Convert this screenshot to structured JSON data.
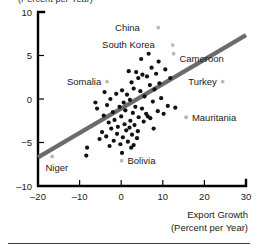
{
  "figure": {
    "ylabel_top_fragment": "(Percent per Year)",
    "footer_rule": "horizontal-rule"
  },
  "chart_data": {
    "type": "scatter",
    "title": "",
    "xlabel": "Export Growth",
    "xlabel_sub": "(Percent per Year)",
    "ylabel": "GDP Growth",
    "ylabel_sub": "(Percent per Year)",
    "xlim": [
      -20,
      30
    ],
    "ylim": [
      -10,
      10
    ],
    "xticks": [
      -20,
      -10,
      0,
      10,
      20,
      30
    ],
    "xtick_labels": [
      "–20",
      "–10",
      "0",
      "10",
      "20",
      "30"
    ],
    "yticks": [
      -10,
      -5,
      0,
      5,
      10
    ],
    "ytick_labels": [
      "–10",
      "−5",
      "0",
      "5",
      "10"
    ],
    "grid": false,
    "legend": "none",
    "trendline": {
      "type": "linear-fit",
      "x_start": -20,
      "y_start": -6.6,
      "x_end": 30,
      "y_end": 8.1,
      "color": "#6b6b6b"
    },
    "marker_color": "#111111",
    "highlight_marker_color": "#b9b9b9",
    "annotations": [
      {
        "label": "China",
        "x": 8.9,
        "y": 8.2,
        "label_x": 4.5,
        "label_y": 8.2,
        "anchor": "end"
      },
      {
        "label": "South Korea",
        "x": 12.4,
        "y": 6.2,
        "label_x": 8.1,
        "label_y": 6.2,
        "anchor": "end"
      },
      {
        "label": "Cameroon",
        "x": 12.6,
        "y": 5.2,
        "label_x": 14.0,
        "label_y": 4.7,
        "anchor": "start"
      },
      {
        "label": "Somalia",
        "x": -3.4,
        "y": 2.0,
        "label_x": -4.8,
        "label_y": 2.0,
        "anchor": "end"
      },
      {
        "label": "Turkey",
        "x": 24.4,
        "y": 2.0,
        "label_x": 23.0,
        "label_y": 2.0,
        "anchor": "end"
      },
      {
        "label": "Mauritania",
        "x": 15.6,
        "y": -2.1,
        "label_x": 17.0,
        "label_y": -2.1,
        "anchor": "start"
      },
      {
        "label": "Bolivia",
        "x": 0.1,
        "y": -7.1,
        "label_x": 1.5,
        "label_y": -7.1,
        "anchor": "start"
      },
      {
        "label": "Niger",
        "x": -16.6,
        "y": -6.6,
        "label_x": -18.2,
        "label_y": -7.9,
        "anchor": "start"
      }
    ],
    "points": [
      {
        "x": 6.6,
        "y": 5.2
      },
      {
        "x": 9.0,
        "y": 4.3
      },
      {
        "x": 7.3,
        "y": 3.6
      },
      {
        "x": 10.6,
        "y": 3.4
      },
      {
        "x": 1.8,
        "y": 3.2
      },
      {
        "x": 3.6,
        "y": 3.1
      },
      {
        "x": 5.1,
        "y": 2.8
      },
      {
        "x": 6.2,
        "y": 2.6
      },
      {
        "x": 4.1,
        "y": 2.4
      },
      {
        "x": 8.4,
        "y": 2.9
      },
      {
        "x": 11.8,
        "y": 2.4
      },
      {
        "x": 2.5,
        "y": 1.9
      },
      {
        "x": 6.9,
        "y": 1.6
      },
      {
        "x": 3.0,
        "y": 1.2
      },
      {
        "x": 0.2,
        "y": 1.0
      },
      {
        "x": 4.6,
        "y": 0.9
      },
      {
        "x": 8.0,
        "y": 1.1
      },
      {
        "x": -1.2,
        "y": 0.6
      },
      {
        "x": 1.4,
        "y": 0.5
      },
      {
        "x": 5.6,
        "y": 0.3
      },
      {
        "x": 9.6,
        "y": 0.1
      },
      {
        "x": -2.6,
        "y": 0.0
      },
      {
        "x": 2.1,
        "y": -0.1
      },
      {
        "x": 0.6,
        "y": -0.4
      },
      {
        "x": 7.6,
        "y": -0.3
      },
      {
        "x": 11.2,
        "y": -0.8
      },
      {
        "x": -3.4,
        "y": -0.7
      },
      {
        "x": -0.4,
        "y": -0.9
      },
      {
        "x": 3.4,
        "y": -0.9
      },
      {
        "x": 5.0,
        "y": -1.1
      },
      {
        "x": -5.8,
        "y": -1.1
      },
      {
        "x": 1.0,
        "y": -1.3
      },
      {
        "x": 8.8,
        "y": -1.4
      },
      {
        "x": -2.0,
        "y": -1.5
      },
      {
        "x": 2.8,
        "y": -1.6
      },
      {
        "x": 6.0,
        "y": -1.7
      },
      {
        "x": 10.2,
        "y": -1.7
      },
      {
        "x": -4.2,
        "y": -1.9
      },
      {
        "x": 0.0,
        "y": -2.0
      },
      {
        "x": 4.2,
        "y": -2.1
      },
      {
        "x": 7.0,
        "y": -2.2
      },
      {
        "x": -1.6,
        "y": -2.4
      },
      {
        "x": 2.2,
        "y": -2.5
      },
      {
        "x": 5.4,
        "y": -2.6
      },
      {
        "x": -3.0,
        "y": -2.7
      },
      {
        "x": 0.8,
        "y": -2.9
      },
      {
        "x": 3.2,
        "y": -3.0
      },
      {
        "x": -0.8,
        "y": -3.2
      },
      {
        "x": 2.0,
        "y": -3.3
      },
      {
        "x": -2.4,
        "y": -3.4
      },
      {
        "x": 1.2,
        "y": -3.6
      },
      {
        "x": 4.0,
        "y": -3.7
      },
      {
        "x": -4.6,
        "y": -3.8
      },
      {
        "x": -1.0,
        "y": -4.0
      },
      {
        "x": 2.6,
        "y": -4.1
      },
      {
        "x": -3.6,
        "y": -4.3
      },
      {
        "x": 0.4,
        "y": -4.4
      },
      {
        "x": 3.8,
        "y": -4.5
      },
      {
        "x": -5.2,
        "y": -4.6
      },
      {
        "x": -1.8,
        "y": -4.8
      },
      {
        "x": 1.6,
        "y": -4.9
      },
      {
        "x": -0.2,
        "y": -5.2
      },
      {
        "x": 3.0,
        "y": -5.3
      },
      {
        "x": -2.8,
        "y": -5.4
      },
      {
        "x": 2.4,
        "y": -5.6
      },
      {
        "x": -8.2,
        "y": -5.6
      },
      {
        "x": -8.4,
        "y": -6.5
      },
      {
        "x": 0.2,
        "y": -6.2
      },
      {
        "x": -6.2,
        "y": -0.4
      },
      {
        "x": 13.0,
        "y": -1.0
      },
      {
        "x": 4.8,
        "y": 4.6
      },
      {
        "x": 7.8,
        "y": -3.4
      },
      {
        "x": 6.4,
        "y": -2.0
      },
      {
        "x": -4.0,
        "y": 0.8
      },
      {
        "x": 9.2,
        "y": 1.8
      }
    ]
  }
}
